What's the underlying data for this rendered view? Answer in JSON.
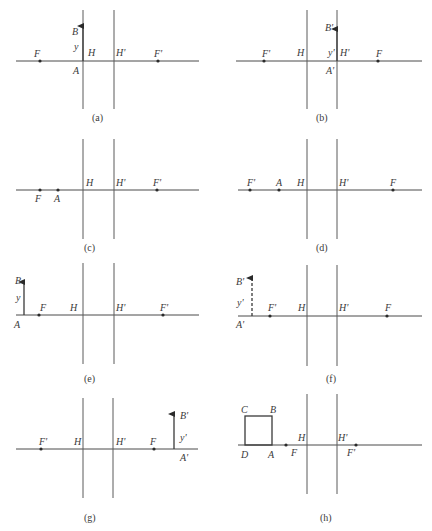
{
  "figure": {
    "panels": [
      {
        "id": "a",
        "caption": "(a)",
        "axis": {
          "y": 61,
          "x1": 16,
          "x2": 199
        },
        "planes": [
          {
            "name": "H",
            "x": 83,
            "y1": 10,
            "y2": 109
          },
          {
            "name": "H'",
            "x": 114,
            "y1": 10,
            "y2": 109
          }
        ],
        "points": [
          {
            "name": "F",
            "x": 40,
            "lx": 34,
            "ly": 57
          },
          {
            "name": "F'",
            "x": 158,
            "lx": 154,
            "ly": 57
          }
        ],
        "labels": [
          {
            "t": "H",
            "x": 88,
            "y": 56
          },
          {
            "t": "H'",
            "x": 116,
            "y": 56
          },
          {
            "t": "B",
            "x": 72,
            "y": 35
          },
          {
            "t": "y",
            "x": 74,
            "y": 50
          },
          {
            "t": "A",
            "x": 73,
            "y": 74
          }
        ],
        "arrows": [
          {
            "x": 83,
            "y1": 61,
            "y2": 26,
            "dashed": false
          }
        ],
        "caption_pos": {
          "x": 92,
          "y": 121
        }
      },
      {
        "id": "b",
        "caption": "(b)",
        "axis": {
          "y": 61,
          "x1": 236,
          "x2": 422
        },
        "planes": [
          {
            "name": "H",
            "x": 307,
            "y1": 10,
            "y2": 109
          },
          {
            "name": "H'",
            "x": 337,
            "y1": 10,
            "y2": 109
          }
        ],
        "points": [
          {
            "name": "F'",
            "x": 264,
            "lx": 262,
            "ly": 57
          },
          {
            "name": "F",
            "x": 378,
            "lx": 376,
            "ly": 57
          }
        ],
        "labels": [
          {
            "t": "F'",
            "x": 262,
            "y": 57
          },
          {
            "t": "H",
            "x": 297,
            "y": 56
          },
          {
            "t": "y'",
            "x": 328,
            "y": 56
          },
          {
            "t": "H'",
            "x": 340,
            "y": 56
          },
          {
            "t": "B'",
            "x": 325,
            "y": 31
          },
          {
            "t": "A'",
            "x": 326,
            "y": 74
          }
        ],
        "arrows": [
          {
            "x": 337,
            "y1": 61,
            "y2": 29,
            "dashed": false
          }
        ],
        "caption_pos": {
          "x": 316,
          "y": 121
        }
      },
      {
        "id": "c",
        "caption": "(c)",
        "axis": {
          "y": 190,
          "x1": 16,
          "x2": 199
        },
        "planes": [
          {
            "name": "H",
            "x": 83,
            "y1": 139,
            "y2": 239
          },
          {
            "name": "H'",
            "x": 114,
            "y1": 139,
            "y2": 239
          }
        ],
        "points": [
          {
            "name": "F",
            "x": 40
          },
          {
            "name": "A",
            "x": 58
          },
          {
            "name": "F'",
            "x": 157
          }
        ],
        "labels": [
          {
            "t": "H",
            "x": 86,
            "y": 186
          },
          {
            "t": "H'",
            "x": 116,
            "y": 186
          },
          {
            "t": "F'",
            "x": 153,
            "y": 186
          },
          {
            "t": "F",
            "x": 35,
            "y": 202
          },
          {
            "t": "A",
            "x": 54,
            "y": 202
          }
        ],
        "arrows": [],
        "caption_pos": {
          "x": 84,
          "y": 251
        }
      },
      {
        "id": "d",
        "caption": "(d)",
        "axis": {
          "y": 190,
          "x1": 238,
          "x2": 422
        },
        "planes": [
          {
            "name": "H",
            "x": 307,
            "y1": 139,
            "y2": 239
          },
          {
            "name": "H'",
            "x": 337,
            "y1": 139,
            "y2": 239
          }
        ],
        "points": [
          {
            "name": "F'",
            "x": 250
          },
          {
            "name": "A",
            "x": 279
          },
          {
            "name": "F",
            "x": 393
          }
        ],
        "labels": [
          {
            "t": "F'",
            "x": 247,
            "y": 186
          },
          {
            "t": "A",
            "x": 276,
            "y": 186
          },
          {
            "t": "H",
            "x": 297,
            "y": 186
          },
          {
            "t": "H'",
            "x": 339,
            "y": 186
          },
          {
            "t": "F",
            "x": 390,
            "y": 186
          }
        ],
        "arrows": [],
        "caption_pos": {
          "x": 316,
          "y": 251
        }
      },
      {
        "id": "e",
        "caption": "(e)",
        "axis": {
          "y": 315,
          "x1": 16,
          "x2": 199
        },
        "planes": [
          {
            "name": "H",
            "x": 83,
            "y1": 263,
            "y2": 364
          },
          {
            "name": "H'",
            "x": 114,
            "y1": 263,
            "y2": 364
          }
        ],
        "points": [
          {
            "name": "F",
            "x": 39
          },
          {
            "name": "F'",
            "x": 163
          }
        ],
        "labels": [
          {
            "t": "B",
            "x": 15,
            "y": 284
          },
          {
            "t": "y",
            "x": 16,
            "y": 301
          },
          {
            "t": "F",
            "x": 40,
            "y": 311
          },
          {
            "t": "H",
            "x": 70,
            "y": 311
          },
          {
            "t": "H'",
            "x": 116,
            "y": 311
          },
          {
            "t": "F'",
            "x": 160,
            "y": 311
          },
          {
            "t": "A",
            "x": 14,
            "y": 328
          }
        ],
        "arrows": [
          {
            "x": 24,
            "y1": 315,
            "y2": 282,
            "dashed": false
          }
        ],
        "caption_pos": {
          "x": 84,
          "y": 382
        }
      },
      {
        "id": "f",
        "caption": "(f)",
        "axis": {
          "y": 316,
          "x1": 238,
          "x2": 422
        },
        "planes": [
          {
            "name": "H",
            "x": 307,
            "y1": 265,
            "y2": 366
          },
          {
            "name": "H'",
            "x": 337,
            "y1": 265,
            "y2": 366
          }
        ],
        "points": [
          {
            "name": "F'",
            "x": 270
          },
          {
            "name": "F",
            "x": 387
          }
        ],
        "labels": [
          {
            "t": "B'",
            "x": 236,
            "y": 285
          },
          {
            "t": "y'",
            "x": 237,
            "y": 306
          },
          {
            "t": "A'",
            "x": 236,
            "y": 328
          },
          {
            "t": "F'",
            "x": 268,
            "y": 311
          },
          {
            "t": "H",
            "x": 298,
            "y": 311
          },
          {
            "t": "H'",
            "x": 339,
            "y": 311
          },
          {
            "t": "F",
            "x": 385,
            "y": 311
          }
        ],
        "arrows": [
          {
            "x": 252,
            "y1": 316,
            "y2": 278,
            "dashed": true
          }
        ],
        "caption_pos": {
          "x": 326,
          "y": 382
        }
      },
      {
        "id": "g",
        "caption": "(g)",
        "axis": {
          "y": 449,
          "x1": 16,
          "x2": 198
        },
        "planes": [
          {
            "name": "H",
            "x": 83,
            "y1": 398,
            "y2": 498
          },
          {
            "name": "H'",
            "x": 113,
            "y1": 398,
            "y2": 498
          }
        ],
        "points": [
          {
            "name": "F'",
            "x": 41
          },
          {
            "name": "F",
            "x": 154
          }
        ],
        "labels": [
          {
            "t": "F'",
            "x": 39,
            "y": 445
          },
          {
            "t": "H",
            "x": 74,
            "y": 445
          },
          {
            "t": "H'",
            "x": 116,
            "y": 445
          },
          {
            "t": "F",
            "x": 150,
            "y": 445
          },
          {
            "t": "B'",
            "x": 180,
            "y": 419
          },
          {
            "t": "y'",
            "x": 180,
            "y": 441
          },
          {
            "t": "A'",
            "x": 180,
            "y": 461
          }
        ],
        "arrows": [
          {
            "x": 174,
            "y1": 449,
            "y2": 414,
            "dashed": false
          }
        ],
        "caption_pos": {
          "x": 84,
          "y": 521
        }
      },
      {
        "id": "h",
        "caption": "(h)",
        "axis": {
          "y": 445,
          "x1": 238,
          "x2": 422
        },
        "planes": [
          {
            "name": "H",
            "x": 307,
            "y1": 394,
            "y2": 494
          },
          {
            "name": "H'",
            "x": 337,
            "y1": 394,
            "y2": 494
          }
        ],
        "points": [
          {
            "name": "F",
            "x": 286
          },
          {
            "name": "F'",
            "x": 356
          }
        ],
        "labels": [
          {
            "t": "C",
            "x": 241,
            "y": 413
          },
          {
            "t": "B",
            "x": 270,
            "y": 413
          },
          {
            "t": "H",
            "x": 298,
            "y": 441
          },
          {
            "t": "H'",
            "x": 338,
            "y": 441
          },
          {
            "t": "D",
            "x": 241,
            "y": 458
          },
          {
            "t": "A",
            "x": 268,
            "y": 458
          },
          {
            "t": "F",
            "x": 291,
            "y": 456
          },
          {
            "t": "F'",
            "x": 347,
            "y": 456
          }
        ],
        "arrows": [],
        "box": {
          "x": 245,
          "y": 416,
          "w": 27,
          "h": 29
        },
        "caption_pos": {
          "x": 320,
          "y": 521
        }
      }
    ]
  }
}
